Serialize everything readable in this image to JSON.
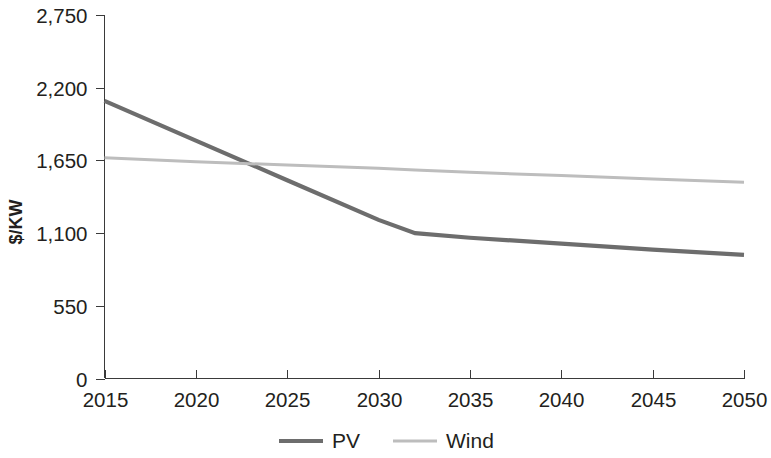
{
  "chart_data": {
    "type": "line",
    "title": "",
    "subtitle": "",
    "xlabel": "",
    "ylabel": "$/KW",
    "x": [
      2015,
      2020,
      2025,
      2030,
      2032,
      2035,
      2040,
      2045,
      2050
    ],
    "xlim": [
      2015,
      2050
    ],
    "ylim": [
      0,
      2750
    ],
    "grid": false,
    "legend_position": "bottom-center",
    "x_tick_labels": [
      "2015",
      "2020",
      "2025",
      "2030",
      "2035",
      "2040",
      "2045",
      "2050"
    ],
    "x_ticks": [
      2015,
      2020,
      2025,
      2030,
      2035,
      2040,
      2045,
      2050
    ],
    "y_tick_labels": [
      "0",
      "550",
      "1,100",
      "1,650",
      "2,200",
      "2,750"
    ],
    "y_ticks": [
      0,
      550,
      1100,
      1650,
      2200,
      2750
    ],
    "series": [
      {
        "name": "PV",
        "color": "#6d6d6d",
        "line_width": 4.2,
        "x": [
          2015,
          2020,
          2025,
          2030,
          2032,
          2035,
          2040,
          2045,
          2050
        ],
        "values": [
          2100,
          1800,
          1500,
          1200,
          1100,
          1065,
          1020,
          975,
          935
        ]
      },
      {
        "name": "Wind",
        "color": "#bdbdbd",
        "line_width": 3.0,
        "x": [
          2015,
          2020,
          2025,
          2030,
          2032,
          2035,
          2040,
          2045,
          2050
        ],
        "values": [
          1670,
          1640,
          1615,
          1590,
          1578,
          1560,
          1535,
          1510,
          1485
        ]
      }
    ],
    "annotations": []
  },
  "legend": {
    "items": [
      {
        "label": "PV",
        "color": "#6d6d6d",
        "line_width": 4.2
      },
      {
        "label": "Wind",
        "color": "#bdbdbd",
        "line_width": 3.0
      }
    ]
  },
  "axes": {
    "y_title": "$/KW"
  }
}
